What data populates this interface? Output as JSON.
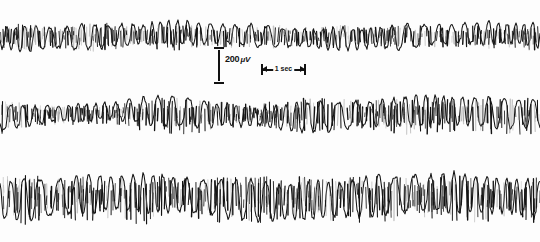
{
  "figure": {
    "background_color": "#fdfdfd",
    "ink_color": "#131313",
    "width": 540,
    "height": 242
  },
  "calibration": {
    "amplitude": {
      "value": "200",
      "unit": "μV",
      "label": "200 μV",
      "x": 214,
      "y": 47,
      "height": 37
    },
    "time": {
      "label": "1 sec",
      "x": 261,
      "y": 64,
      "width": 45
    }
  },
  "chart_data": {
    "type": "line",
    "xlabel": "Time",
    "ylabel": "Amplitude",
    "grid": false,
    "legend_position": "none",
    "axis_ranges": {
      "x_seconds": [
        0,
        12
      ],
      "y_microvolts": [
        -300,
        300
      ]
    },
    "calibration": {
      "amplitude_microvolts": 200,
      "amplitude_bar_pixels": 37,
      "time_seconds": 1,
      "time_bar_pixels": 45
    },
    "series": [
      {
        "name": "Channel 1",
        "baseline_y": 36,
        "seed": 1731,
        "samples": 540,
        "base_amplitude": 13,
        "spike_amplitude": 9,
        "frequency": 1.52,
        "envelope": [
          0.78,
          0.95,
          0.7,
          1.0,
          0.88,
          0.72,
          0.95,
          0.82,
          0.66,
          0.9,
          0.76,
          0.62,
          0.85,
          0.72,
          0.95,
          0.8,
          0.64,
          0.9,
          0.74,
          1.0
        ],
        "ghost": false,
        "roughness": 0.55
      },
      {
        "name": "Channel 2",
        "baseline_y": 114,
        "seed": 4492,
        "samples": 540,
        "base_amplitude": 15,
        "spike_amplitude": 12,
        "frequency": 1.46,
        "envelope": [
          0.95,
          0.62,
          0.5,
          0.55,
          0.48,
          0.85,
          1.0,
          0.9,
          0.72,
          0.6,
          0.85,
          1.0,
          0.92,
          0.78,
          0.95,
          1.0,
          0.88,
          0.95,
          1.0,
          0.9
        ],
        "ghost": false,
        "roughness": 0.5
      },
      {
        "name": "Channel 3",
        "baseline_y": 197,
        "seed": 9117,
        "samples": 540,
        "base_amplitude": 20,
        "spike_amplitude": 16,
        "frequency": 1.38,
        "envelope": [
          0.92,
          1.0,
          0.85,
          0.95,
          0.8,
          1.0,
          0.9,
          0.78,
          0.95,
          1.0,
          0.86,
          0.96,
          0.82,
          1.0,
          0.9,
          0.84,
          1.0,
          0.92,
          0.8,
          1.0
        ],
        "ghost": false,
        "roughness": 0.45
      }
    ]
  }
}
